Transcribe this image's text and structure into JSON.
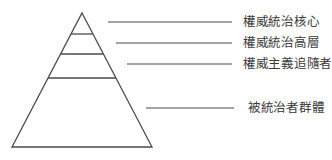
{
  "diagram": {
    "type": "pyramid",
    "colors": {
      "stroke": "#4a4a4a",
      "text": "#3a3a3a",
      "background": "#ffffff"
    },
    "levels": [
      {
        "label": "權威統治核心"
      },
      {
        "label": "權威統治高層"
      },
      {
        "label": "權威主義追隨者"
      },
      {
        "label": "被統治者群體"
      }
    ]
  }
}
